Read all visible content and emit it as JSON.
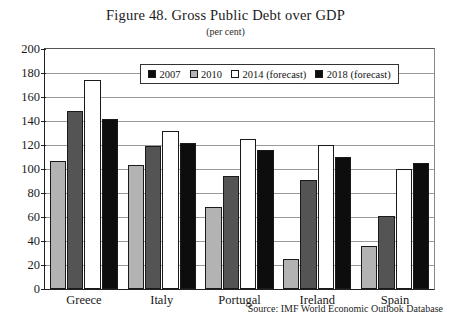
{
  "chart_data": {
    "type": "bar",
    "title": "Figure 48. Gross Public Debt over GDP",
    "subtitle": "(per cent)",
    "xlabel": "",
    "ylabel": "",
    "ylim": [
      0,
      200
    ],
    "ytick_step": 20,
    "yticks": [
      200,
      180,
      160,
      140,
      120,
      100,
      80,
      60,
      40,
      20,
      0
    ],
    "grid": true,
    "legend_position": "top-center",
    "categories": [
      "Greece",
      "Italy",
      "Portugal",
      "Ireland",
      "Spain"
    ],
    "series": [
      {
        "name": "2007",
        "color": "#b3b3b3",
        "legend_color": "#0d0d0d",
        "values": [
          107,
          103,
          68,
          25,
          36
        ]
      },
      {
        "name": "2010",
        "color": "#545454",
        "legend_color": "#b3b3b3",
        "values": [
          148,
          119,
          94,
          91,
          61
        ]
      },
      {
        "name": "2014 (forecast)",
        "color": "#ffffff",
        "legend_color": "#ffffff",
        "values": [
          174,
          132,
          125,
          120,
          100
        ]
      },
      {
        "name": "2018 (forecast)",
        "color": "#0d0d0d",
        "legend_color": "#0d0d0d",
        "values": [
          142,
          122,
          116,
          110,
          105
        ]
      }
    ],
    "source": "Source: IMF World Economic Outlook Database"
  }
}
